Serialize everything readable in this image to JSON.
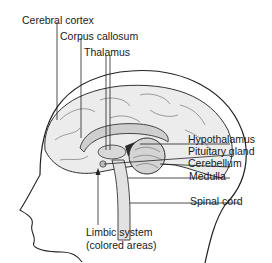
{
  "diagram": {
    "labels": {
      "cerebral_cortex": "Cerebral cortex",
      "corpus_callosum": "Corpus callosum",
      "thalamus": "Thalamus",
      "hypothalamus": "Hypothalamus",
      "pituitary_gland": "Pituitary gland",
      "cerebellum": "Cerebellum",
      "medulla": "Medulla",
      "spinal_cord": "Spinal cord",
      "limbic_system_line1": "Limbic system",
      "limbic_system_line2": "(colored areas)"
    },
    "colors": {
      "ink": "#1a1a1a",
      "brain_fill": "#e6e6e6",
      "colored_area": "#2a2a2a"
    }
  }
}
